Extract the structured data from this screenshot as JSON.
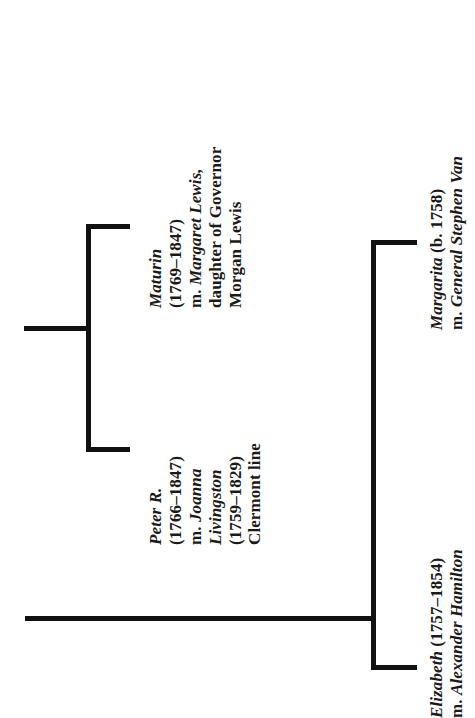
{
  "document": {
    "type": "genealogy-chart",
    "orientation": "text-rotated-90-ccw",
    "background_color": "#ffffff",
    "line_color": "#111111"
  },
  "people": [
    {
      "id": "maturin",
      "lines": [
        "Maturin",
        "(1769–1847)",
        "m. Margaret Lewis,",
        "daughter of Governor",
        "Morgan Lewis"
      ],
      "styles": [
        "ital",
        "rom",
        "mixed",
        "rom",
        "rom"
      ]
    },
    {
      "id": "peter-r",
      "lines": [
        "Peter R.",
        "(1766–1847)",
        "m. Joanna",
        "Livingston",
        "(1759–1829)",
        "Clermont line"
      ],
      "styles": [
        "ital",
        "rom",
        "mixed",
        "ital",
        "rom",
        "rom"
      ]
    },
    {
      "id": "margarita",
      "lines": [
        "Margarita (b. 1758)",
        "m. General Stephen Van"
      ],
      "styles": [
        "mixed",
        "mixed"
      ]
    },
    {
      "id": "elizabeth",
      "lines": [
        "Elizabeth (1757–1854)",
        "m. Alexander Hamilton"
      ],
      "styles": [
        "mixed",
        "mixed"
      ]
    }
  ],
  "text_blocks": {
    "maturin": {
      "line1": "Maturin",
      "line2": "(1769–1847)",
      "line3_prefix": "m. ",
      "line3_name": "Margaret Lewis,",
      "line4": "daughter of Governor",
      "line5": "Morgan Lewis"
    },
    "peter": {
      "line1": "Peter R.",
      "line2": "(1766–1847)",
      "line3_prefix": "m. ",
      "line3_name": "Joanna",
      "line4": "Livingston",
      "line5": "(1759–1829)",
      "line6": "Clermont line"
    },
    "margarita": {
      "line1_name": "Margarita ",
      "line1_dates": "(b. 1758)",
      "line2_prefix": "m. ",
      "line2_name": "General Stephen Van"
    },
    "elizabeth": {
      "line1_name": "Elizabeth ",
      "line1_dates": "(1757–1854)",
      "line2_prefix": "m. ",
      "line2_name": "Alexander Hamilton"
    }
  },
  "connectors": {
    "left_bracket": {
      "label": "left-sibling-bracket",
      "vertical_x": 88,
      "top_y": 224,
      "bottom_y": 447,
      "arm_end_x": 128,
      "stub_y": 328,
      "stub_start_x": 24
    },
    "right_bracket": {
      "label": "right-sibling-bracket",
      "vertical_x": 373,
      "top_y": 240,
      "bottom_y": 665,
      "arm_end_x": 415
    },
    "trunk": {
      "label": "main-horizontal-trunk",
      "y": 618,
      "start_x": 25,
      "end_x": 378
    }
  }
}
